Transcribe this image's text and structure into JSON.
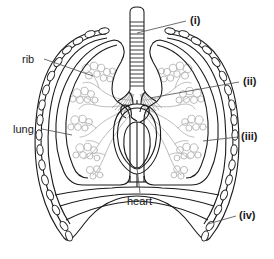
{
  "figure": {
    "colors": {
      "background": "#ffffff",
      "outline": "#1a1a1a",
      "rib_outline": "#222222",
      "rib_fill": "#ffffff",
      "bronchial_tree": "#b0b0b0",
      "alveoli": "#bdbdbd",
      "leader_line": "#555555",
      "label_text": "#1a1a1a"
    },
    "labels": [
      {
        "id": "rib",
        "text": "rib",
        "kind": "plain",
        "x": 22,
        "y": 54,
        "leader": {
          "from": [
            44,
            59
          ],
          "to": [
            93,
            76
          ]
        }
      },
      {
        "id": "lung",
        "text": "lung",
        "kind": "plain",
        "x": 13,
        "y": 124,
        "leader": {
          "from": [
            42,
            129
          ],
          "to": [
            72,
            135
          ]
        }
      },
      {
        "id": "heart",
        "text": "heart",
        "kind": "plain",
        "x": 127,
        "y": 196,
        "leader": {
          "from": [
            140,
            193
          ],
          "to": [
            137,
            168
          ]
        }
      },
      {
        "id": "i",
        "text": "(i)",
        "kind": "roman",
        "x": 190,
        "y": 15,
        "leader": {
          "from": [
            186,
            21
          ],
          "to": [
            137,
            33
          ]
        }
      },
      {
        "id": "ii",
        "text": "(ii)",
        "kind": "roman",
        "x": 243,
        "y": 76,
        "leader": {
          "from": [
            239,
            82
          ],
          "to": [
            150,
            98
          ]
        }
      },
      {
        "id": "iii",
        "text": "(iii)",
        "kind": "roman",
        "x": 241,
        "y": 131,
        "leader": {
          "from": [
            238,
            137
          ],
          "to": [
            203,
            141
          ]
        }
      },
      {
        "id": "iv",
        "text": "(iv)",
        "kind": "roman",
        "x": 239,
        "y": 210,
        "leader": {
          "from": [
            236,
            216
          ],
          "to": [
            208,
            224
          ]
        }
      }
    ],
    "parts": [
      {
        "name": "trachea",
        "labelled_as": "(i)"
      },
      {
        "name": "bronchiole",
        "labelled_as": "(ii)"
      },
      {
        "name": "rib",
        "labelled_as": "rib"
      },
      {
        "name": "lung",
        "labelled_as": "lung"
      },
      {
        "name": "heart",
        "labelled_as": "heart"
      },
      {
        "name": "alveoli",
        "labelled_as": "(iii)"
      },
      {
        "name": "diaphragm",
        "labelled_as": "(iv)"
      }
    ]
  }
}
